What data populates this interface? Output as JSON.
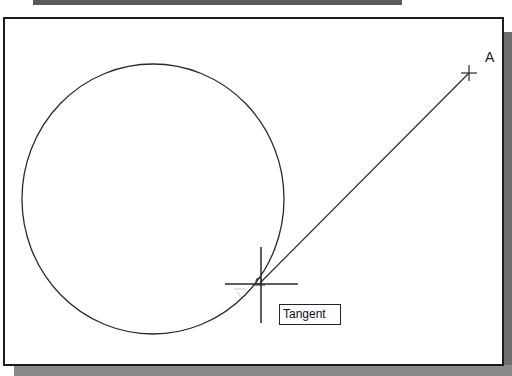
{
  "canvas": {
    "point_label": "A",
    "tooltip": "Tangent",
    "snap_mode": "Tangent"
  },
  "geometry": {
    "circle": {
      "cx": 153,
      "cy": 199,
      "rx": 131,
      "ry": 135
    },
    "line": {
      "x1": 260,
      "y1": 283,
      "x2": 469,
      "y2": 73
    },
    "cursor": {
      "x": 261,
      "y": 284
    },
    "point_a": {
      "x": 469,
      "y": 73
    }
  },
  "colors": {
    "stroke": "#2a2a2a",
    "frame": "#1c1c1c",
    "shadow": "#6e6e6e"
  }
}
